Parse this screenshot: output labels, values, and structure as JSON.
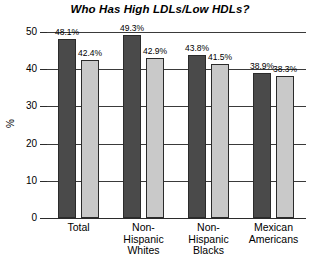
{
  "chart_data": {
    "type": "bar",
    "title": "Who Has High LDLs/Low HDLs?",
    "xlabel": "",
    "ylabel": "%",
    "ylim": [
      0,
      50
    ],
    "yticks": [
      0,
      10,
      20,
      30,
      40,
      50
    ],
    "ytick_labels": [
      "0",
      "10",
      "20",
      "30",
      "40",
      "50"
    ],
    "grid": true,
    "legend": "none",
    "categories": [
      "Total",
      "Non-\nHispanic\nWhites",
      "Non-\nHispanic\nBlacks",
      "Mexican\nAmericans"
    ],
    "series": [
      {
        "name": "series-1",
        "color": "#4a4a4a",
        "values": [
          48.1,
          49.3,
          43.8,
          38.9
        ],
        "data_labels": [
          "48.1%",
          "49.3%",
          "43.8%",
          "38.9%"
        ]
      },
      {
        "name": "series-2",
        "color": "#c9c9c9",
        "values": [
          42.4,
          42.9,
          41.5,
          38.3
        ],
        "data_labels": [
          "42.4%",
          "42.9%",
          "41.5%",
          "38.3%"
        ]
      }
    ]
  }
}
